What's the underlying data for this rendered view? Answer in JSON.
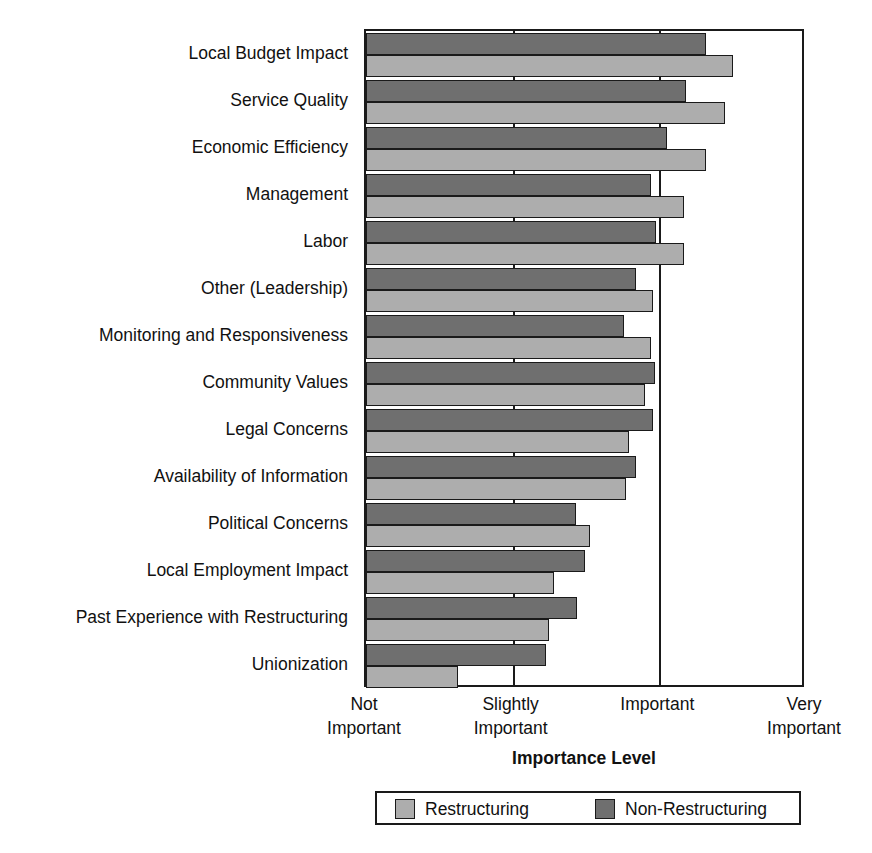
{
  "chart_data": {
    "type": "bar",
    "orientation": "horizontal",
    "title": "",
    "xlabel": "Importance Level",
    "ylabel": "",
    "grid": true,
    "legend_position": "bottom",
    "xlim": [
      1,
      4
    ],
    "xticks": [
      1,
      2,
      3,
      4
    ],
    "xticklabels": [
      [
        "Not",
        "Important"
      ],
      [
        "Slightly",
        "Important"
      ],
      [
        "Important",
        ""
      ],
      [
        "Very",
        "Important"
      ]
    ],
    "categories": [
      "Local Budget Impact",
      "Service Quality",
      "Economic Efficiency",
      "Management",
      "Labor",
      "Other (Leadership)",
      "Monitoring and Responsiveness",
      "Community Values",
      "Legal Concerns",
      "Availability of Information",
      "Political Concerns",
      "Local Employment Impact",
      "Past Experience with Restructuring",
      "Unionization"
    ],
    "series": [
      {
        "name": "Restructuring",
        "color": "#adadad",
        "values": [
          3.5,
          3.45,
          3.32,
          3.17,
          3.17,
          2.96,
          2.94,
          2.9,
          2.79,
          2.77,
          2.53,
          2.28,
          2.25,
          1.63
        ]
      },
      {
        "name": "Non-Restructuring",
        "color": "#6f6f6f",
        "values": [
          3.32,
          3.18,
          3.05,
          2.94,
          2.98,
          2.84,
          2.76,
          2.97,
          2.96,
          2.84,
          2.43,
          2.49,
          2.44,
          2.23
        ]
      }
    ]
  },
  "axis": {
    "title": "Importance Level"
  },
  "legend": {
    "items": [
      {
        "label": "Restructuring",
        "swatch": "light"
      },
      {
        "label": "Non-Restructuring",
        "swatch": "dark"
      }
    ]
  }
}
